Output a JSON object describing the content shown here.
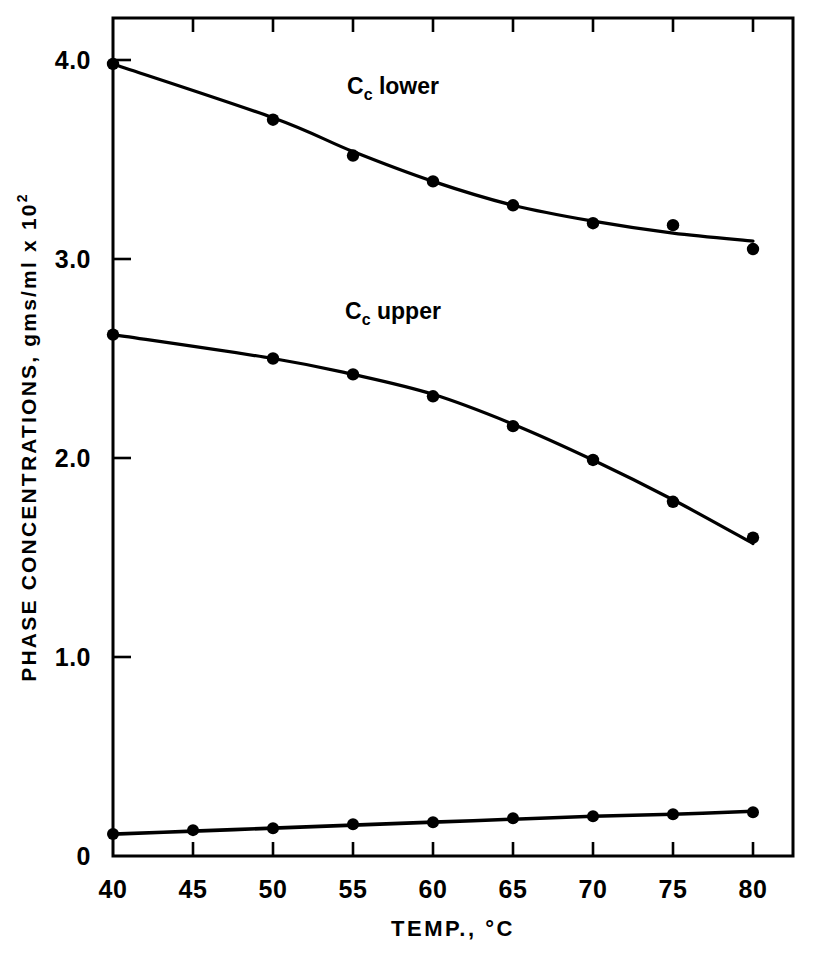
{
  "chart_data": {
    "type": "line",
    "title": "",
    "xlabel": "TEMP., °C",
    "ylabel": "PHASE  CONCENTRATIONS,  gms/ml  x  10",
    "ylabel_exponent": "2",
    "xlim": [
      40,
      80
    ],
    "ylim": [
      0,
      4.2
    ],
    "xticks": [
      40,
      45,
      50,
      55,
      60,
      65,
      70,
      75,
      80
    ],
    "xtick_labels": [
      "40",
      "45",
      "50",
      "55",
      "60",
      "65",
      "70",
      "75",
      "80"
    ],
    "yticks": [
      0,
      1.0,
      2.0,
      3.0,
      4.0
    ],
    "ytick_labels": [
      "0",
      "1.0",
      "2.0",
      "3.0",
      "4.0"
    ],
    "grid": false,
    "legend_position": "inline-annotations",
    "series": [
      {
        "name": "Cc lower",
        "label_text": "C",
        "label_sub": "c",
        "label_suffix": " lower",
        "label_x": 57.5,
        "label_y": 3.83,
        "x": [
          40,
          50,
          55,
          60,
          65,
          70,
          75,
          80
        ],
        "values": [
          3.98,
          3.7,
          3.52,
          3.39,
          3.27,
          3.18,
          3.17,
          3.05
        ],
        "curve_values": [
          3.98,
          3.71,
          3.54,
          3.39,
          3.27,
          3.19,
          3.13,
          3.09
        ]
      },
      {
        "name": "Cc upper",
        "label_text": "C",
        "label_sub": "c",
        "label_suffix": " upper",
        "label_x": 57.5,
        "label_y": 2.7,
        "x": [
          40,
          50,
          55,
          60,
          65,
          70,
          75,
          80
        ],
        "values": [
          2.62,
          2.5,
          2.42,
          2.31,
          2.16,
          1.99,
          1.78,
          1.6
        ],
        "curve_values": [
          2.62,
          2.5,
          2.42,
          2.32,
          2.17,
          1.99,
          1.79,
          1.57
        ]
      },
      {
        "name": "lower baseline",
        "label_text": "",
        "label_sub": "",
        "label_suffix": "",
        "x": [
          40,
          45,
          50,
          55,
          60,
          65,
          70,
          75,
          80
        ],
        "values": [
          0.11,
          0.13,
          0.14,
          0.16,
          0.17,
          0.19,
          0.2,
          0.21,
          0.22
        ],
        "curve_values": [
          0.11,
          0.125,
          0.14,
          0.155,
          0.17,
          0.185,
          0.2,
          0.21,
          0.225
        ]
      }
    ]
  },
  "figure": {
    "background_color": "#ffffff",
    "ink_color": "#000000"
  }
}
